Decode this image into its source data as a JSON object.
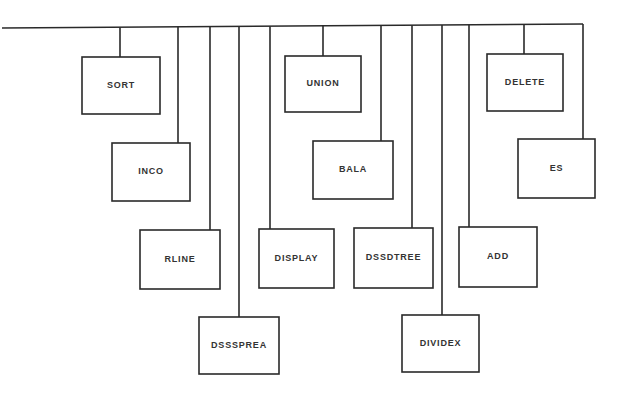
{
  "diagram": {
    "type": "hierarchy-bus",
    "bus": {
      "x1": 2,
      "y1": 28,
      "x2": 583,
      "y2": 24
    },
    "colors": {
      "stroke": "#2a2a2a",
      "text": "#333333",
      "background": "#ffffff"
    },
    "nodes": [
      {
        "id": "sort",
        "label": "SORT",
        "stem_x": 120,
        "box": [
          82,
          57,
          78,
          57
        ]
      },
      {
        "id": "inco",
        "label": "INCO",
        "stem_x": 178,
        "box": [
          112,
          143,
          78,
          58
        ]
      },
      {
        "id": "rline",
        "label": "RLINE",
        "stem_x": 210,
        "box": [
          140,
          230,
          80,
          59
        ]
      },
      {
        "id": "dsssprea",
        "label": "DSSSPREA",
        "stem_x": 239,
        "box": [
          199,
          317,
          80,
          57
        ]
      },
      {
        "id": "display",
        "label": "DISPLAY",
        "stem_x": 270,
        "box": [
          259,
          229,
          75,
          59
        ]
      },
      {
        "id": "union",
        "label": "UNION",
        "stem_x": 323,
        "box": [
          285,
          56,
          76,
          56
        ]
      },
      {
        "id": "bala",
        "label": "BALA",
        "stem_x": 381,
        "box": [
          313,
          141,
          80,
          58
        ]
      },
      {
        "id": "dssdtree",
        "label": "DSSDTREE",
        "stem_x": 412,
        "box": [
          354,
          228,
          79,
          60
        ]
      },
      {
        "id": "dividex",
        "label": "DIVIDEX",
        "stem_x": 442,
        "box": [
          402,
          315,
          77,
          57
        ]
      },
      {
        "id": "add",
        "label": "ADD",
        "stem_x": 469,
        "box": [
          459,
          227,
          78,
          60
        ]
      },
      {
        "id": "delete",
        "label": "DELETE",
        "stem_x": 524,
        "box": [
          487,
          54,
          76,
          57
        ]
      },
      {
        "id": "es",
        "label": "ES",
        "stem_x": 583,
        "box": [
          518,
          139,
          77,
          59
        ]
      }
    ]
  }
}
